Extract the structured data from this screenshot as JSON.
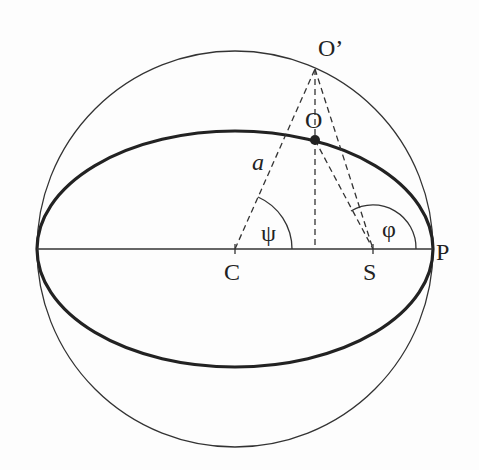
{
  "figure": {
    "type": "geometry-diagram"
  },
  "labels": {
    "O_prime": "O’",
    "O": "O",
    "a": "a",
    "psi": "ψ",
    "phi": "φ",
    "C": "C",
    "S": "S",
    "P": "P"
  },
  "geometry": {
    "center": {
      "x": 235,
      "y": 249
    },
    "circle_radius": 198,
    "ellipse": {
      "rx": 198,
      "ry": 118
    },
    "O_prime": {
      "x": 315,
      "y": 69
    },
    "O": {
      "x": 315,
      "y": 140
    },
    "S": {
      "x": 373,
      "y": 249
    },
    "foot": {
      "x": 315,
      "y": 249
    },
    "P": {
      "x": 433,
      "y": 249
    }
  },
  "colors": {
    "ink": "#222222",
    "background": "#fdfdfd"
  }
}
